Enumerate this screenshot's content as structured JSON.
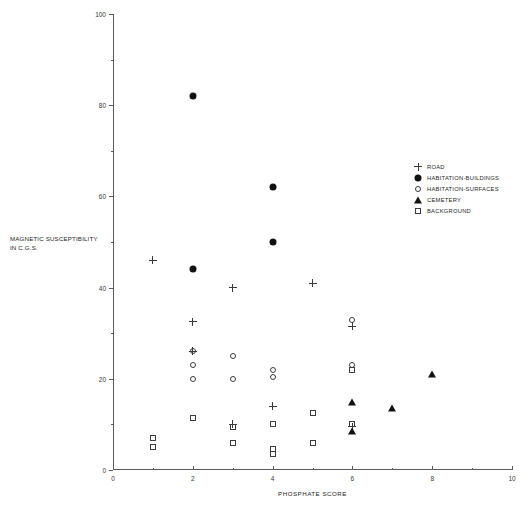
{
  "chart_data": {
    "type": "scatter",
    "title": "",
    "xlabel": "PHOSPHATE SCORE",
    "ylabel": "MAGNETIC SUSCEPTIBILITY IN C.G.S.",
    "ylabel_line1": "MAGNETIC SUSCEPTIBILITY",
    "ylabel_line2": "IN C.G.S.",
    "xlim": [
      0,
      10
    ],
    "ylim": [
      0,
      100
    ],
    "x_ticks": [
      0,
      2,
      4,
      6,
      8,
      10
    ],
    "x_ticklabels": [
      "0",
      "2",
      "4",
      "6",
      "8",
      "10"
    ],
    "x_minor_ticks": [
      1,
      3,
      5,
      7,
      9
    ],
    "y_ticks": [
      0,
      20,
      40,
      60,
      80,
      100
    ],
    "y_ticklabels": [
      "0",
      "20",
      "40",
      "60",
      "80",
      "100"
    ],
    "y_minor_ticks": [
      10,
      30,
      50,
      70,
      90
    ],
    "grid": false,
    "legend_position": "upper right",
    "series": [
      {
        "name": "ROAD",
        "marker": "plus",
        "points": [
          {
            "x": 1,
            "y": 46
          },
          {
            "x": 2,
            "y": 32.5
          },
          {
            "x": 2,
            "y": 26
          },
          {
            "x": 3,
            "y": 40
          },
          {
            "x": 3,
            "y": 10
          },
          {
            "x": 4,
            "y": 14
          },
          {
            "x": 5,
            "y": 41
          },
          {
            "x": 6,
            "y": 31.5
          },
          {
            "x": 6,
            "y": 9.5
          }
        ]
      },
      {
        "name": "HABITATION-BUILDINGS",
        "marker": "filled-circle",
        "points": [
          {
            "x": 2,
            "y": 82
          },
          {
            "x": 2,
            "y": 44
          },
          {
            "x": 4,
            "y": 62
          },
          {
            "x": 4,
            "y": 50
          }
        ]
      },
      {
        "name": "HABITATION-SURFACES",
        "marker": "open-circle",
        "points": [
          {
            "x": 2,
            "y": 26
          },
          {
            "x": 2,
            "y": 23
          },
          {
            "x": 2,
            "y": 20
          },
          {
            "x": 3,
            "y": 25
          },
          {
            "x": 3,
            "y": 20
          },
          {
            "x": 4,
            "y": 22
          },
          {
            "x": 4,
            "y": 20.5
          },
          {
            "x": 6,
            "y": 33
          },
          {
            "x": 6,
            "y": 23
          }
        ]
      },
      {
        "name": "CEMETERY",
        "marker": "filled-triangle",
        "points": [
          {
            "x": 6,
            "y": 15
          },
          {
            "x": 6,
            "y": 8.5
          },
          {
            "x": 7,
            "y": 13.5
          },
          {
            "x": 8,
            "y": 21
          }
        ]
      },
      {
        "name": "BACKGROUND",
        "marker": "open-square",
        "points": [
          {
            "x": 1,
            "y": 7
          },
          {
            "x": 1,
            "y": 5
          },
          {
            "x": 2,
            "y": 11.5
          },
          {
            "x": 3,
            "y": 9.5
          },
          {
            "x": 3,
            "y": 6
          },
          {
            "x": 4,
            "y": 10
          },
          {
            "x": 4,
            "y": 4.5
          },
          {
            "x": 4,
            "y": 3.5
          },
          {
            "x": 5,
            "y": 12.5
          },
          {
            "x": 5,
            "y": 6
          },
          {
            "x": 6,
            "y": 22
          },
          {
            "x": 6,
            "y": 10
          }
        ]
      }
    ]
  },
  "legend": {
    "items": [
      {
        "label": "ROAD",
        "marker": "plus"
      },
      {
        "label": "HABITATION-BUILDINGS",
        "marker": "filled-circle"
      },
      {
        "label": "HABITATION-SURFACES",
        "marker": "open-circle"
      },
      {
        "label": "CEMETERY",
        "marker": "filled-triangle"
      },
      {
        "label": "BACKGROUND",
        "marker": "open-square"
      }
    ]
  },
  "colors": {
    "axis": "#5b5b5b",
    "marker_fill": "#111111",
    "marker_stroke": "#3c3c3c",
    "text": "#262626"
  }
}
